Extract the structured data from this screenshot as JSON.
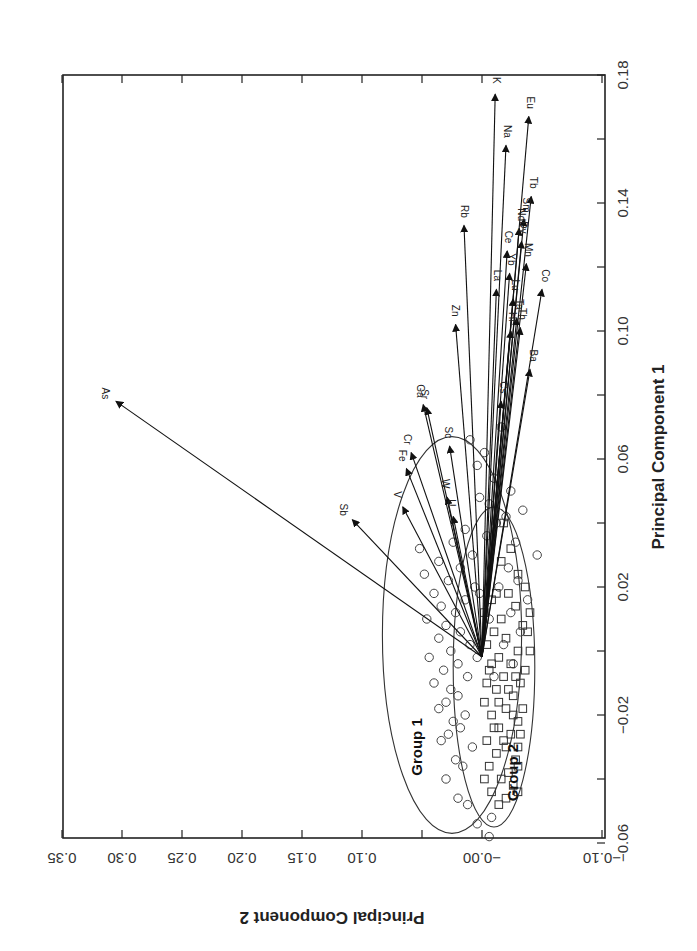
{
  "chart_data": {
    "type": "scatter",
    "subtype": "pca-biplot",
    "orientation": "rotated-90-clockwise",
    "title": "",
    "xlabel": "Principal Component 1",
    "ylabel": "Principal Component 2",
    "xlim": [
      -0.06,
      0.18
    ],
    "ylim": [
      -0.1,
      0.35
    ],
    "x_ticks": [
      "-0.06",
      "-0.02",
      "0.02",
      "0.06",
      "0.10",
      "0.14",
      "0.18"
    ],
    "x_tick_values": [
      -0.06,
      -0.02,
      0.02,
      0.06,
      0.1,
      0.14,
      0.18
    ],
    "x_minor_ticks": [
      -0.04,
      0.0,
      0.04,
      0.08,
      0.12,
      0.16
    ],
    "y_ticks": [
      "-0.10",
      "-0.00",
      "0.10",
      "0.15",
      "0.20",
      "0.25",
      "0.30",
      "0.35"
    ],
    "y_tick_values": [
      -0.1,
      0.0,
      0.1,
      0.15,
      0.2,
      0.25,
      0.3,
      0.35
    ],
    "grid": false,
    "legend": null,
    "groups": [
      {
        "name": "Group 1",
        "marker": "circle",
        "ellipse": {
          "cx_pc1": 0.005,
          "cy_pc2": 0.025,
          "r_pc1": 0.062,
          "r_pc2": 0.058
        }
      },
      {
        "name": "Group 2",
        "marker": "square",
        "ellipse": {
          "cx_pc1": -0.005,
          "cy_pc2": -0.01,
          "r_pc1": 0.05,
          "r_pc2": 0.034
        }
      }
    ],
    "loadings": [
      {
        "name": "K",
        "pc1": 0.174,
        "pc2": -0.011
      },
      {
        "name": "Eu",
        "pc1": 0.167,
        "pc2": -0.039
      },
      {
        "name": "Na",
        "pc1": 0.158,
        "pc2": -0.02
      },
      {
        "name": "Rb",
        "pc1": 0.133,
        "pc2": 0.015
      },
      {
        "name": "Tb",
        "pc1": 0.142,
        "pc2": -0.041
      },
      {
        "name": "Nd",
        "pc1": 0.132,
        "pc2": -0.031
      },
      {
        "name": "Sm",
        "pc1": 0.135,
        "pc2": -0.035
      },
      {
        "name": "Ce",
        "pc1": 0.125,
        "pc2": -0.021
      },
      {
        "name": "Dy",
        "pc1": 0.128,
        "pc2": -0.033
      },
      {
        "name": "La",
        "pc1": 0.113,
        "pc2": -0.012
      },
      {
        "name": "Yb",
        "pc1": 0.118,
        "pc2": -0.023
      },
      {
        "name": "Mn",
        "pc1": 0.121,
        "pc2": -0.037
      },
      {
        "name": "Lu",
        "pc1": 0.11,
        "pc2": -0.026
      },
      {
        "name": "Co",
        "pc1": 0.113,
        "pc2": -0.05
      },
      {
        "name": "Hf",
        "pc1": 0.1,
        "pc2": -0.024
      },
      {
        "name": "Ta",
        "pc1": 0.104,
        "pc2": -0.029
      },
      {
        "name": "Th",
        "pc1": 0.101,
        "pc2": -0.032
      },
      {
        "name": "Ba",
        "pc1": 0.088,
        "pc2": -0.04
      },
      {
        "name": "Zn",
        "pc1": 0.102,
        "pc2": 0.022
      },
      {
        "name": "Cs",
        "pc1": 0.078,
        "pc2": -0.016
      },
      {
        "name": "Ga",
        "pc1": 0.077,
        "pc2": 0.049
      },
      {
        "name": "Sr",
        "pc1": 0.076,
        "pc2": 0.046
      },
      {
        "name": "Sc",
        "pc1": 0.064,
        "pc2": 0.027
      },
      {
        "name": "Cr",
        "pc1": 0.062,
        "pc2": 0.059
      },
      {
        "name": "Fe",
        "pc1": 0.057,
        "pc2": 0.063
      },
      {
        "name": "V",
        "pc1": 0.045,
        "pc2": 0.066
      },
      {
        "name": "W",
        "pc1": 0.048,
        "pc2": 0.029
      },
      {
        "name": "U",
        "pc1": 0.042,
        "pc2": 0.024
      },
      {
        "name": "Sb",
        "pc1": 0.041,
        "pc2": 0.108
      },
      {
        "name": "As",
        "pc1": 0.078,
        "pc2": 0.305
      }
    ],
    "group_labels": [
      {
        "text": "Group 1",
        "pc1": -0.03,
        "pc2": 0.05
      },
      {
        "text": "Group 2",
        "pc1": -0.038,
        "pc2": -0.03
      }
    ],
    "points_group1_circles": [
      [
        -0.064,
        -0.002
      ],
      [
        -0.06,
        0.01
      ],
      [
        -0.058,
        -0.006
      ],
      [
        -0.054,
        0.004
      ],
      [
        -0.052,
        -0.008
      ],
      [
        -0.048,
        0.012
      ],
      [
        -0.046,
        0.02
      ],
      [
        -0.04,
        0.03
      ],
      [
        -0.036,
        0.016
      ],
      [
        -0.034,
        0.022
      ],
      [
        -0.03,
        0.008
      ],
      [
        -0.028,
        0.034
      ],
      [
        -0.026,
        0.028
      ],
      [
        -0.024,
        0.018
      ],
      [
        -0.022,
        0.024
      ],
      [
        -0.02,
        0.014
      ],
      [
        -0.018,
        0.036
      ],
      [
        -0.016,
        0.03
      ],
      [
        -0.014,
        0.02
      ],
      [
        -0.012,
        0.026
      ],
      [
        -0.01,
        0.04
      ],
      [
        -0.008,
        0.012
      ],
      [
        -0.006,
        0.032
      ],
      [
        -0.004,
        0.02
      ],
      [
        -0.002,
        0.044
      ],
      [
        0.0,
        0.026
      ],
      [
        0.002,
        0.01
      ],
      [
        0.004,
        0.036
      ],
      [
        0.006,
        0.018
      ],
      [
        0.008,
        0.03
      ],
      [
        0.01,
        0.046
      ],
      [
        0.012,
        0.022
      ],
      [
        0.014,
        0.034
      ],
      [
        0.016,
        0.014
      ],
      [
        0.018,
        0.04
      ],
      [
        0.02,
        0.006
      ],
      [
        0.022,
        0.028
      ],
      [
        0.024,
        0.048
      ],
      [
        0.026,
        0.018
      ],
      [
        0.028,
        0.036
      ],
      [
        0.03,
        0.008
      ],
      [
        0.032,
        0.052
      ],
      [
        0.034,
        0.024
      ],
      [
        0.036,
        -0.004
      ],
      [
        0.038,
        0.014
      ],
      [
        0.04,
        -0.012
      ],
      [
        0.042,
        -0.02
      ],
      [
        0.044,
        -0.034
      ],
      [
        0.046,
        -0.006
      ],
      [
        0.048,
        0.002
      ],
      [
        0.05,
        -0.024
      ],
      [
        0.054,
        -0.01
      ],
      [
        0.058,
        0.004
      ],
      [
        0.062,
        -0.002
      ],
      [
        0.066,
        0.01
      ],
      [
        0.07,
        -0.016
      ],
      [
        0.03,
        -0.046
      ],
      [
        0.022,
        -0.03
      ],
      [
        0.016,
        -0.038
      ],
      [
        0.012,
        -0.024
      ],
      [
        0.006,
        -0.032
      ],
      [
        0.002,
        -0.018
      ],
      [
        -0.004,
        -0.026
      ],
      [
        -0.008,
        -0.01
      ],
      [
        0.01,
        -0.006
      ],
      [
        0.02,
        -0.014
      ],
      [
        0.026,
        -0.022
      ],
      [
        0.034,
        -0.028
      ],
      [
        0.018,
        0.002
      ],
      [
        -0.002,
        0.004
      ]
    ],
    "points_group2_squares": [
      [
        -0.048,
        -0.014
      ],
      [
        -0.046,
        -0.02
      ],
      [
        -0.044,
        -0.008
      ],
      [
        -0.042,
        -0.026
      ],
      [
        -0.04,
        -0.016
      ],
      [
        -0.038,
        -0.022
      ],
      [
        -0.036,
        -0.006
      ],
      [
        -0.034,
        -0.028
      ],
      [
        -0.032,
        -0.012
      ],
      [
        -0.03,
        -0.02
      ],
      [
        -0.028,
        -0.004
      ],
      [
        -0.026,
        -0.024
      ],
      [
        -0.024,
        -0.014
      ],
      [
        -0.022,
        -0.03
      ],
      [
        -0.02,
        -0.008
      ],
      [
        -0.018,
        -0.02
      ],
      [
        -0.016,
        -0.002
      ],
      [
        -0.014,
        -0.026
      ],
      [
        -0.012,
        -0.012
      ],
      [
        -0.01,
        -0.032
      ],
      [
        -0.008,
        -0.018
      ],
      [
        -0.006,
        -0.006
      ],
      [
        -0.004,
        -0.024
      ],
      [
        -0.002,
        -0.014
      ],
      [
        0.0,
        -0.03
      ],
      [
        0.002,
        -0.004
      ],
      [
        0.004,
        -0.02
      ],
      [
        0.006,
        -0.01
      ],
      [
        0.008,
        -0.034
      ],
      [
        0.01,
        -0.016
      ],
      [
        0.012,
        -0.002
      ],
      [
        0.014,
        -0.028
      ],
      [
        0.016,
        -0.008
      ],
      [
        0.018,
        -0.022
      ],
      [
        0.02,
        -0.036
      ],
      [
        -0.028,
        -0.018
      ],
      [
        -0.024,
        -0.01
      ],
      [
        -0.02,
        -0.026
      ],
      [
        -0.016,
        -0.014
      ],
      [
        -0.012,
        -0.022
      ],
      [
        -0.008,
        -0.028
      ],
      [
        -0.004,
        -0.008
      ],
      [
        -0.03,
        -0.03
      ],
      [
        -0.026,
        -0.032
      ],
      [
        -0.018,
        -0.034
      ],
      [
        -0.01,
        -0.004
      ],
      [
        0.024,
        -0.03
      ],
      [
        0.028,
        -0.016
      ],
      [
        0.032,
        -0.024
      ],
      [
        -0.036,
        -0.03
      ],
      [
        -0.04,
        -0.002
      ],
      [
        -0.044,
        -0.03
      ],
      [
        0.0,
        -0.04
      ],
      [
        0.006,
        -0.038
      ],
      [
        -0.006,
        -0.036
      ],
      [
        0.04,
        -0.018
      ],
      [
        -0.062,
        -0.002
      ],
      [
        0.012,
        -0.04
      ],
      [
        0.018,
        -0.012
      ]
    ]
  },
  "axes": {
    "pc1_title": "Principal Component 1",
    "pc2_title": "Principal Component 2"
  }
}
